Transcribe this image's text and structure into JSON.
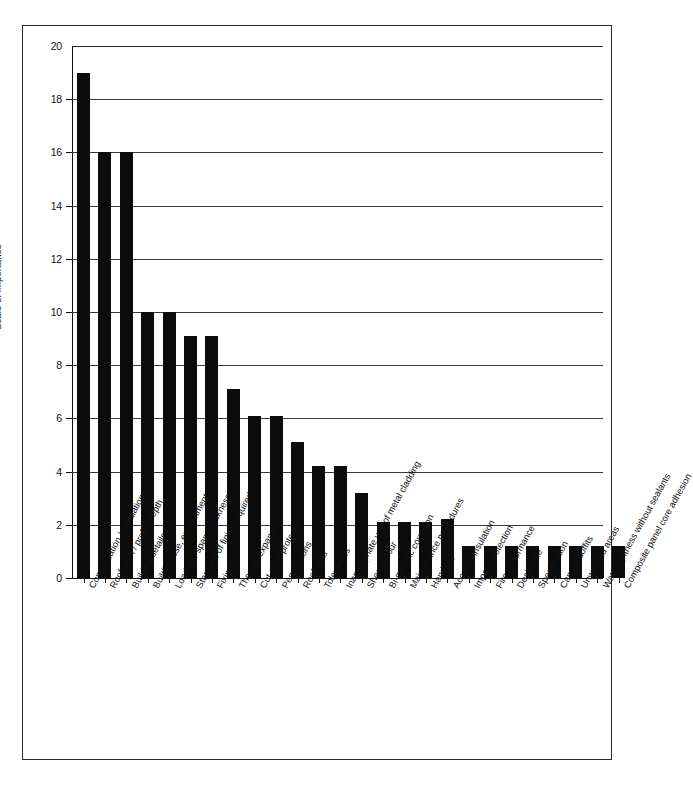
{
  "chart_data": {
    "type": "bar",
    "title": "",
    "xlabel": "",
    "ylabel": "Scale of importance",
    "ylim": [
      0,
      20
    ],
    "ytick_labels": [
      "20",
      "18",
      "16",
      "14",
      "12",
      "10",
      "8",
      "6",
      "4",
      "2",
      "0"
    ],
    "ytick_values": [
      20,
      18,
      16,
      14,
      12,
      10,
      8,
      6,
      4,
      2,
      0
    ],
    "grid": true,
    "legend": "none",
    "orientation": "vertical",
    "bar_color": "#0b0b0b",
    "categories": [
      "Condensation / ventilation",
      "Roof pitch / profile depth",
      "Building details",
      "Building use, environment",
      "Loading / span / thickness",
      "Standard of finish required",
      "Fixings",
      "Thermal expansion",
      "Cut edge protection",
      "Penetrations",
      "Rooflights",
      "Tolerances",
      "Inappropriate use of metal cladding",
      "Sheet colour",
      "Bi-metallic corrosion",
      "Maintenance procedures",
      "Handling",
      "Acoustic insulation",
      "Impact protection",
      "Fire performance",
      "Design life",
      "Specification",
      "Canopy soffits",
      "Unwashed areas",
      "Watertightness without sealants",
      "Composite panel core adhesion"
    ],
    "values": [
      19,
      16,
      16,
      10,
      10,
      9.1,
      9.1,
      7.1,
      6.1,
      6.1,
      5.1,
      4.2,
      4.2,
      3.2,
      2.1,
      2.1,
      2.1,
      2.2,
      1.2,
      1.2,
      1.2,
      1.2,
      1.2,
      1.2,
      1.2,
      1.2
    ]
  }
}
